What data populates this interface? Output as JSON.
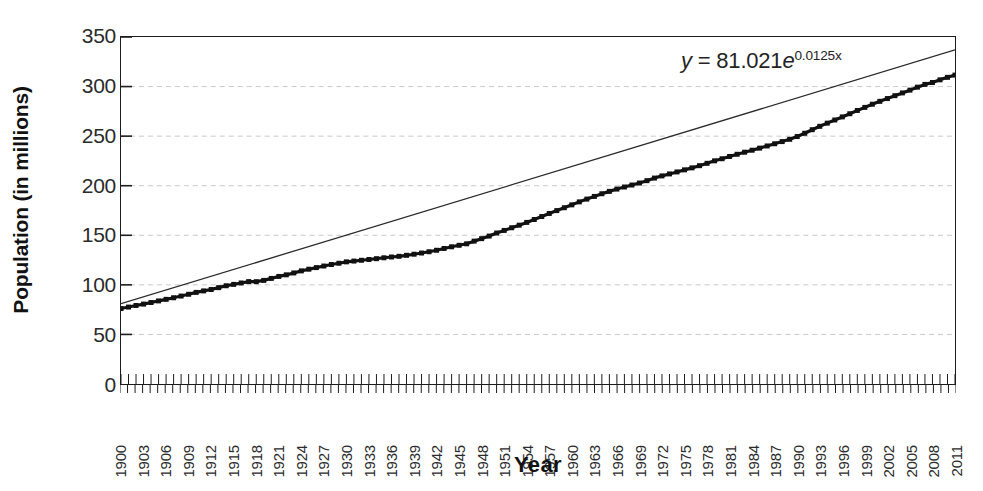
{
  "chart_data": {
    "type": "line",
    "title": "",
    "xlabel": "Year",
    "ylabel": "Population (in millions)",
    "xlim": [
      1900,
      2011
    ],
    "ylim": [
      0,
      350
    ],
    "grid": true,
    "legend": "none",
    "annotations": [
      {
        "name": "trendline-equation",
        "text": "y = 81.021e^{0.0125x}",
        "parts": {
          "lhs": "y",
          "equals": "=",
          "coefficient": "81.021",
          "base": "e",
          "exponent": "0.0125x"
        }
      }
    ],
    "ytick_labels": [
      "0",
      "50",
      "100",
      "150",
      "200",
      "250",
      "300",
      "350"
    ],
    "ytick_values": [
      0,
      50,
      100,
      150,
      200,
      250,
      300,
      350
    ],
    "xtick_labels": [
      "1900",
      "1903",
      "1906",
      "1909",
      "1912",
      "1915",
      "1918",
      "1921",
      "1924",
      "1927",
      "1930",
      "1933",
      "1936",
      "1939",
      "1942",
      "1945",
      "1948",
      "1951",
      "1954",
      "1957",
      "1960",
      "1963",
      "1966",
      "1969",
      "1972",
      "1975",
      "1978",
      "1981",
      "1984",
      "1987",
      "1990",
      "1993",
      "1996",
      "1999",
      "2002",
      "2005",
      "2008",
      "2011"
    ],
    "xtick_values": [
      1900,
      1903,
      1906,
      1909,
      1912,
      1915,
      1918,
      1921,
      1924,
      1927,
      1930,
      1933,
      1936,
      1939,
      1942,
      1945,
      1948,
      1951,
      1954,
      1957,
      1960,
      1963,
      1966,
      1969,
      1972,
      1975,
      1978,
      1981,
      1984,
      1987,
      1990,
      1993,
      1996,
      1999,
      2002,
      2005,
      2008,
      2011
    ],
    "series": [
      {
        "name": "Population",
        "style": "line-with-square-markers",
        "color": "#111111",
        "x": [
          1900,
          1901,
          1902,
          1903,
          1904,
          1905,
          1906,
          1907,
          1908,
          1909,
          1910,
          1911,
          1912,
          1913,
          1914,
          1915,
          1916,
          1917,
          1918,
          1919,
          1920,
          1921,
          1922,
          1923,
          1924,
          1925,
          1926,
          1927,
          1928,
          1929,
          1930,
          1931,
          1932,
          1933,
          1934,
          1935,
          1936,
          1937,
          1938,
          1939,
          1940,
          1941,
          1942,
          1943,
          1944,
          1945,
          1946,
          1947,
          1948,
          1949,
          1950,
          1951,
          1952,
          1953,
          1954,
          1955,
          1956,
          1957,
          1958,
          1959,
          1960,
          1961,
          1962,
          1963,
          1964,
          1965,
          1966,
          1967,
          1968,
          1969,
          1970,
          1971,
          1972,
          1973,
          1974,
          1975,
          1976,
          1977,
          1978,
          1979,
          1980,
          1981,
          1982,
          1983,
          1984,
          1985,
          1986,
          1987,
          1988,
          1989,
          1990,
          1991,
          1992,
          1993,
          1994,
          1995,
          1996,
          1997,
          1998,
          1999,
          2000,
          2001,
          2002,
          2003,
          2004,
          2005,
          2006,
          2007,
          2008,
          2009,
          2010,
          2011
        ],
        "y": [
          76.1,
          77.6,
          79.2,
          80.6,
          82.2,
          83.8,
          85.4,
          87.0,
          88.7,
          90.5,
          92.4,
          93.9,
          95.3,
          97.2,
          99.1,
          100.5,
          101.9,
          103.3,
          103.2,
          104.5,
          106.5,
          108.5,
          110.1,
          112.0,
          114.1,
          115.8,
          117.4,
          119.0,
          120.5,
          121.8,
          123.2,
          124.0,
          124.8,
          125.6,
          126.4,
          127.3,
          128.1,
          128.8,
          129.8,
          130.9,
          132.1,
          133.4,
          134.9,
          136.7,
          138.4,
          139.9,
          141.4,
          144.1,
          146.6,
          149.2,
          152.3,
          154.9,
          157.6,
          160.2,
          163.0,
          165.9,
          168.9,
          172.0,
          174.9,
          177.8,
          180.7,
          183.7,
          186.5,
          189.2,
          191.9,
          194.3,
          196.6,
          198.7,
          200.7,
          202.7,
          205.1,
          207.7,
          209.9,
          211.9,
          213.9,
          216.0,
          218.0,
          220.2,
          222.6,
          225.1,
          227.2,
          229.5,
          231.7,
          233.8,
          235.8,
          237.9,
          240.1,
          242.3,
          244.5,
          246.8,
          249.6,
          252.9,
          256.5,
          259.9,
          263.1,
          266.3,
          269.4,
          272.6,
          275.9,
          279.0,
          282.2,
          285.1,
          287.9,
          290.8,
          293.6,
          296.4,
          299.4,
          302.2,
          304.1,
          306.8,
          309.3,
          311.6
        ]
      },
      {
        "name": "Exponential trendline",
        "style": "thin-line",
        "color": "#2a2a2a",
        "equation": "y = 81.021e^{0.0125x}",
        "coefficient": 81.021,
        "rate": 0.0125,
        "x": [
          1900,
          2011
        ],
        "y": [
          81.0,
          337.0
        ]
      }
    ]
  }
}
